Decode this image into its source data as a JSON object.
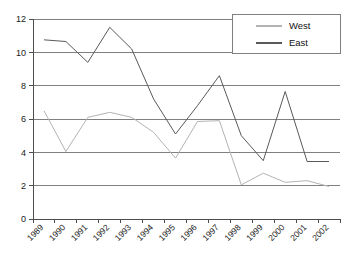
{
  "chart_data": {
    "type": "line",
    "title": "",
    "subtitle": "",
    "xlabel": "",
    "ylabel": "",
    "categories": [
      "1989",
      "1990",
      "1991",
      "1992",
      "1993",
      "1994",
      "1995",
      "1996",
      "1997",
      "1998",
      "1999",
      "2000",
      "2001",
      "2002"
    ],
    "series": [
      {
        "name": "West",
        "color": "#b3b3b3",
        "values": [
          6.5,
          4.05,
          6.1,
          6.4,
          6.1,
          5.2,
          3.65,
          5.85,
          5.9,
          2.05,
          2.75,
          2.2,
          2.3,
          1.95
        ]
      },
      {
        "name": "East",
        "color": "#595959",
        "values": [
          10.75,
          10.65,
          9.4,
          11.5,
          10.2,
          7.2,
          5.1,
          6.8,
          8.6,
          5.0,
          3.5,
          7.65,
          3.45,
          3.45
        ]
      }
    ],
    "ylim": [
      0,
      12
    ],
    "yticks": [
      "0",
      "2",
      "4",
      "6",
      "8",
      "10",
      "12"
    ],
    "ytick_values": [
      0,
      2,
      4,
      6,
      8,
      10,
      12
    ],
    "grid": true,
    "grid_axis": "y",
    "grid_color": "#808080",
    "axis_color": "#4d4d4d",
    "legend_position": "top-right",
    "xtick_rotation": -45,
    "background": "#ffffff"
  },
  "legend": {
    "entries": [
      {
        "label": "West",
        "color": "#b3b3b3"
      },
      {
        "label": "East",
        "color": "#595959"
      }
    ]
  },
  "axes": {
    "y_labels": [
      "12",
      "10",
      "8",
      "6",
      "4",
      "2",
      "0"
    ],
    "x_labels": [
      "1989",
      "1990",
      "1991",
      "1992",
      "1993",
      "1994",
      "1995",
      "1996",
      "1997",
      "1998",
      "1999",
      "2000",
      "2001",
      "2002"
    ]
  }
}
